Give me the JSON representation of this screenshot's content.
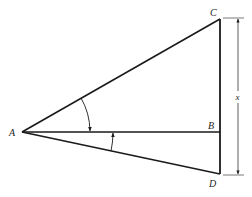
{
  "diagram": {
    "type": "geometry",
    "points": {
      "A": {
        "label": "A",
        "x": 22,
        "y": 132
      },
      "B": {
        "label": "B",
        "x": 220,
        "y": 132
      },
      "C": {
        "label": "C",
        "x": 220,
        "y": 19
      },
      "D": {
        "label": "D",
        "x": 220,
        "y": 174
      }
    },
    "segments": [
      {
        "from": "A",
        "to": "C"
      },
      {
        "from": "A",
        "to": "B"
      },
      {
        "from": "A",
        "to": "D"
      },
      {
        "from": "C",
        "to": "D"
      }
    ],
    "angles": [
      {
        "name": "angle-CAB",
        "vertex": "A",
        "from": "C",
        "to": "B",
        "arrow_toward": "B"
      },
      {
        "name": "angle-DAB",
        "vertex": "A",
        "from": "D",
        "to": "B",
        "arrow_toward": "B"
      }
    ],
    "dimension": {
      "label": "x",
      "from": "C",
      "to": "D",
      "line_x": 238
    },
    "colors": {
      "stroke": "#1a1a1a",
      "background": "#ffffff"
    }
  }
}
